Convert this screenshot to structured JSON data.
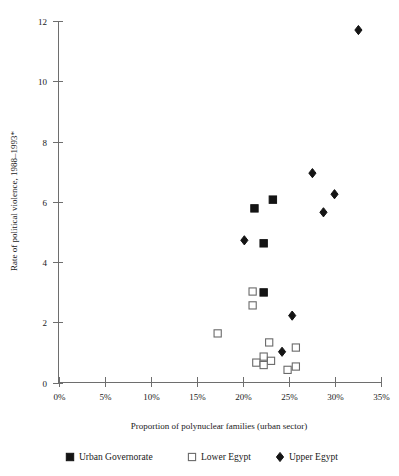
{
  "chart_data": {
    "type": "scatter",
    "title": "",
    "xlabel": "Proportion of polynuclear families (urban sector)",
    "ylabel": "Rate of political violence, 1988–1993*",
    "xlim": [
      0,
      35
    ],
    "ylim": [
      0,
      12
    ],
    "xticks": [
      0,
      5,
      10,
      15,
      20,
      25,
      30,
      35
    ],
    "xtick_labels": [
      "0%",
      "5%",
      "10%",
      "15%",
      "20%",
      "25%",
      "30%",
      "35%"
    ],
    "yticks": [
      0,
      2,
      4,
      6,
      8,
      10,
      12
    ],
    "ytick_labels": [
      "0",
      "2",
      "4",
      "6",
      "8",
      "10",
      "12"
    ],
    "grid": false,
    "legend_position": "bottom",
    "series": [
      {
        "name": "Urban Governorate",
        "marker": "filled-square",
        "color": "#141414",
        "points": [
          {
            "x": 23.3,
            "y": 6.07
          },
          {
            "x": 21.3,
            "y": 5.78
          },
          {
            "x": 22.3,
            "y": 4.62
          },
          {
            "x": 22.3,
            "y": 2.99
          }
        ]
      },
      {
        "name": "Lower Egypt",
        "marker": "open-square",
        "color": "#6a6a6a",
        "points": [
          {
            "x": 21.1,
            "y": 3.02
          },
          {
            "x": 21.1,
            "y": 2.56
          },
          {
            "x": 17.3,
            "y": 1.63
          },
          {
            "x": 22.9,
            "y": 1.33
          },
          {
            "x": 25.8,
            "y": 1.16
          },
          {
            "x": 22.3,
            "y": 0.86
          },
          {
            "x": 23.1,
            "y": 0.72
          },
          {
            "x": 21.5,
            "y": 0.66
          },
          {
            "x": 22.3,
            "y": 0.58
          },
          {
            "x": 24.9,
            "y": 0.42
          },
          {
            "x": 25.8,
            "y": 0.53
          }
        ]
      },
      {
        "name": "Upper Egypt",
        "marker": "filled-diamond",
        "color": "#141414",
        "points": [
          {
            "x": 32.6,
            "y": 11.7
          },
          {
            "x": 27.6,
            "y": 6.95
          },
          {
            "x": 30.0,
            "y": 6.25
          },
          {
            "x": 28.8,
            "y": 5.65
          },
          {
            "x": 20.2,
            "y": 4.72
          },
          {
            "x": 25.4,
            "y": 2.22
          },
          {
            "x": 24.3,
            "y": 1.02
          }
        ]
      }
    ]
  },
  "legend": {
    "items": [
      {
        "label": "Urban Governorate",
        "marker": "filled-square"
      },
      {
        "label": "Lower Egypt",
        "marker": "open-square"
      },
      {
        "label": "Upper Egypt",
        "marker": "filled-diamond"
      }
    ]
  },
  "axes": {
    "x_axis_title": "Proportion of polynuclear families (urban sector)",
    "y_axis_title": "Rate of political violence, 1988–1993*"
  }
}
